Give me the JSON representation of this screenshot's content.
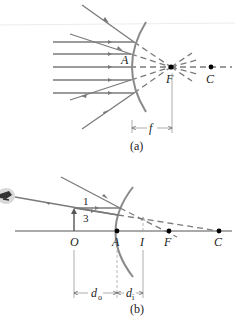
{
  "figure": {
    "part_a": {
      "caption": "(a)",
      "labels": {
        "vertex": "A",
        "focal_point": "F",
        "center": "C",
        "focal_length": "f"
      }
    },
    "part_b": {
      "caption": "(b)",
      "labels": {
        "object": "O",
        "vertex": "A",
        "image": "I",
        "focal_point": "F",
        "center": "C",
        "ray1": "1",
        "ray3": "3",
        "object_distance": "d",
        "object_distance_sub": "o",
        "image_distance": "d",
        "image_distance_sub": "i"
      }
    },
    "colors": {
      "ray": "#7a7a7a",
      "mirror": "#8a8a8a",
      "text": "#222222",
      "point": "#000000"
    }
  }
}
